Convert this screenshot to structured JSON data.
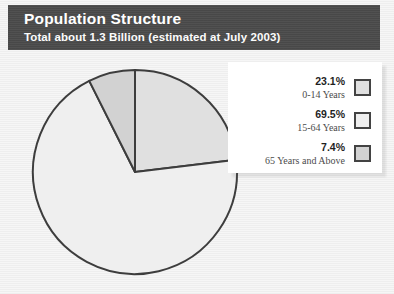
{
  "header": {
    "title": "Population Structure",
    "subtitle": "Total about 1.3 Billion (estimated at July 2003)",
    "bar_color": "#4b4b4b",
    "text_color": "#ffffff"
  },
  "legend": {
    "entries": [
      {
        "percent": "23.1%",
        "label": "0-14 Years",
        "swatch_fill": "#e0e0e0",
        "swatch_border": "#434343"
      },
      {
        "percent": "69.5%",
        "label": "15-64 Years",
        "swatch_fill": "#efefef",
        "swatch_border": "#434343"
      },
      {
        "percent": "7.4%",
        "label": "65 Years and Above",
        "swatch_fill": "#d2d2d2",
        "swatch_border": "#434343"
      }
    ]
  },
  "chart_data": {
    "type": "pie",
    "title": "Population Structure",
    "subtitle": "Total about 1.3 Billion (estimated at July 2003)",
    "categories": [
      "0-14 Years",
      "15-64 Years",
      "65 Years and Above"
    ],
    "values": [
      23.1,
      69.5,
      7.4
    ],
    "value_labels": [
      "23.1%",
      "69.5%",
      "7.4%"
    ],
    "unit": "percent",
    "total_label": "Total about 1.3 Billion (estimated at July 2003)",
    "start_angle_deg": 0,
    "direction": "clockwise",
    "slice_colors": [
      "#e0e0e0",
      "#efefef",
      "#d2d2d2"
    ],
    "slice_outline": "#3d3d3d",
    "legend_position": "right",
    "grid": false
  },
  "canvas": {
    "background": "#f3f3f3"
  }
}
